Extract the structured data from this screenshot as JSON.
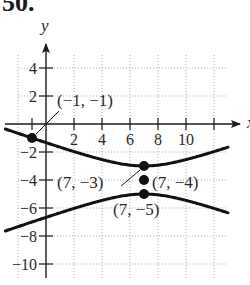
{
  "problem": {
    "number": "50."
  },
  "chart_data": {
    "type": "line",
    "title": "",
    "xlabel": "x",
    "ylabel": "y",
    "xlim": [
      -3,
      14
    ],
    "ylim": [
      -11,
      6
    ],
    "grid": true,
    "x_ticks": [
      2,
      4,
      6,
      8,
      10
    ],
    "y_ticks": [
      4,
      2,
      -2,
      -4,
      -6,
      -8,
      -10
    ],
    "x_tick_labels": [
      "2",
      "4",
      "6",
      "8",
      "10"
    ],
    "y_tick_labels": [
      "4",
      "2",
      "−2",
      "−4",
      "−6",
      "−8",
      "−10"
    ],
    "equation": "(y+4)^2 - (x-7)^2/8 = 1",
    "series": [
      {
        "name": "upper branch",
        "center": [
          7,
          -4
        ],
        "a": 1,
        "b2": 8,
        "sign": 1
      },
      {
        "name": "lower branch",
        "center": [
          7,
          -4
        ],
        "a": 1,
        "b2": 8,
        "sign": -1
      }
    ],
    "points": [
      {
        "x": -1,
        "y": -1,
        "label": "(−1, −1)"
      },
      {
        "x": 7,
        "y": -3,
        "label": "(7, −3)"
      },
      {
        "x": 7,
        "y": -4,
        "label": "(7, −4)"
      },
      {
        "x": 7,
        "y": -5,
        "label": "(7, −5)"
      }
    ]
  }
}
